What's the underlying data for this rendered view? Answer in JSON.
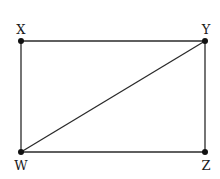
{
  "diagram": {
    "type": "rectangle-with-diagonal",
    "stroke_color": "#2a2a2a",
    "points": {
      "X": {
        "label": "X",
        "x": 21,
        "y": 41
      },
      "Y": {
        "label": "Y",
        "x": 205,
        "y": 41
      },
      "Z": {
        "label": "Z",
        "x": 205,
        "y": 152
      },
      "W": {
        "label": "W",
        "x": 21,
        "y": 152
      }
    },
    "segments": [
      "XY",
      "YZ",
      "ZW",
      "WX",
      "WY"
    ]
  }
}
